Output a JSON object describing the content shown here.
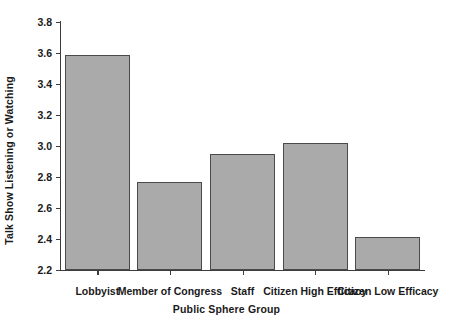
{
  "chart_data": {
    "type": "bar",
    "title": "",
    "xlabel": "Public Sphere Group",
    "ylabel": "Talk Show Listening or Watching",
    "categories": [
      "Lobbyist",
      "Member of Congress",
      "Staff",
      "Citizen High Efficacy",
      "Citizen Low Efficacy"
    ],
    "values": [
      3.59,
      2.77,
      2.95,
      3.02,
      2.41
    ],
    "ylim": [
      2.2,
      3.8
    ],
    "ytick_labels": [
      "2.2",
      "2.4",
      "2.6",
      "2.8",
      "3.0",
      "3.2",
      "3.4",
      "3.6",
      "3.8"
    ],
    "ytick_values": [
      2.2,
      2.4,
      2.6,
      2.8,
      3.0,
      3.2,
      3.4,
      3.6,
      3.8
    ],
    "grid": false,
    "legend": "none",
    "bar_color": "#aaaaaa",
    "bar_edge_color": "#4a4a4a",
    "axis_color": "#3c3c3c",
    "background": "#ffffff"
  }
}
